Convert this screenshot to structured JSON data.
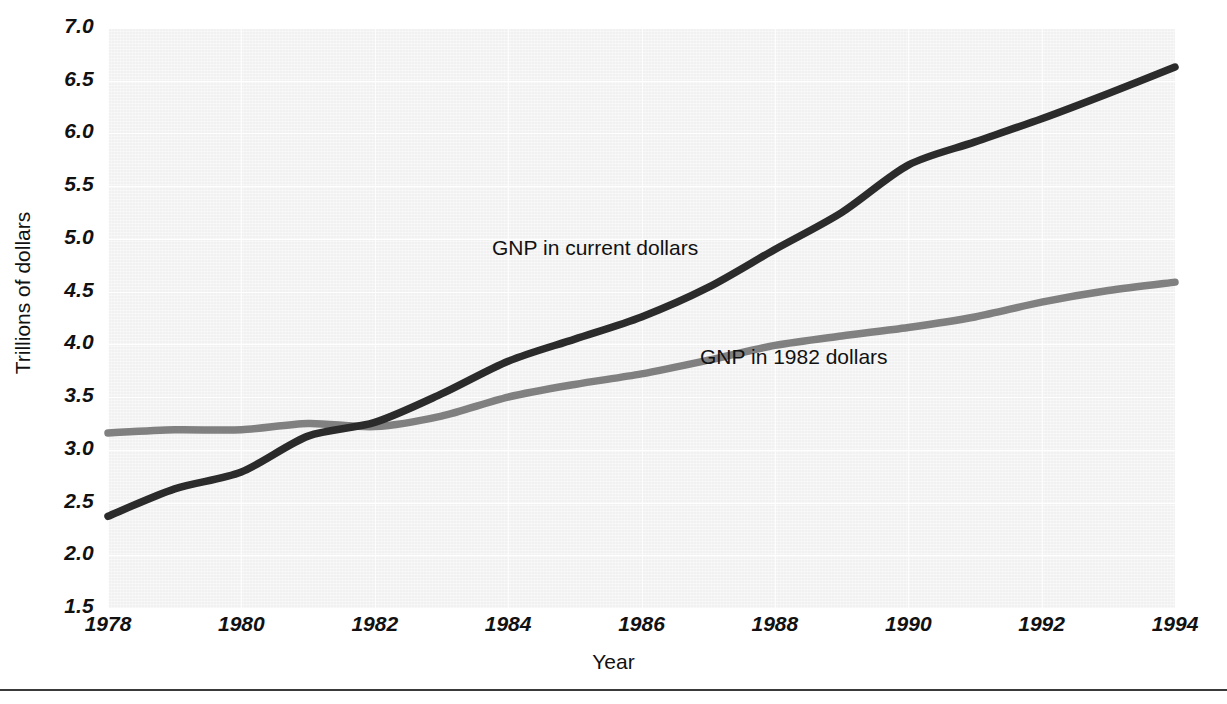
{
  "chart_data": {
    "type": "line",
    "title": "",
    "xlabel": "Year",
    "ylabel": "Trillions of dollars",
    "xlim": [
      1978,
      1994
    ],
    "ylim": [
      1.5,
      7.0
    ],
    "grid": true,
    "legend_position": "inline-annotations",
    "x_ticks": [
      "1978",
      "1980",
      "1982",
      "1984",
      "1986",
      "1988",
      "1990",
      "1992",
      "1994"
    ],
    "y_ticks": [
      "1.5",
      "2.0",
      "2.5",
      "3.0",
      "3.5",
      "4.0",
      "4.5",
      "5.0",
      "5.5",
      "6.0",
      "6.5",
      "7.0"
    ],
    "x": [
      1978,
      1979,
      1980,
      1981,
      1982,
      1983,
      1984,
      1985,
      1986,
      1987,
      1988,
      1989,
      1990,
      1991,
      1992,
      1993,
      1994
    ],
    "series": [
      {
        "name": "GNP in current dollars",
        "color": "#2b2b2b",
        "values": [
          2.37,
          2.63,
          2.79,
          3.13,
          3.26,
          3.53,
          3.84,
          4.05,
          4.26,
          4.54,
          4.9,
          5.25,
          5.7,
          5.92,
          6.14,
          6.38,
          6.63
        ]
      },
      {
        "name": "GNP in 1982 dollars",
        "color": "#808080",
        "values": [
          3.16,
          3.19,
          3.19,
          3.25,
          3.22,
          3.32,
          3.5,
          3.62,
          3.72,
          3.85,
          3.99,
          4.08,
          4.16,
          4.26,
          4.4,
          4.51,
          4.59
        ]
      }
    ],
    "annotations": [
      {
        "text": "GNP in current dollars",
        "series": "GNP in current dollars"
      },
      {
        "text": "GNP in 1982 dollars",
        "series": "GNP in 1982 dollars"
      }
    ]
  },
  "axes": {
    "y_title": "Trillions of dollars",
    "x_title": "Year",
    "y_ticks": [
      "7.0",
      "6.5",
      "6.0",
      "5.5",
      "5.0",
      "4.5",
      "4.0",
      "3.5",
      "3.0",
      "2.5",
      "2.0",
      "1.5"
    ],
    "x_ticks": [
      "1978",
      "1980",
      "1982",
      "1984",
      "1986",
      "1988",
      "1990",
      "1992",
      "1994"
    ]
  },
  "labels": {
    "current_dollars": "GNP in current dollars",
    "constant_1982_dollars": "GNP in 1982 dollars"
  },
  "colors": {
    "current_dollars_line": "#2b2b2b",
    "constant_dollars_line": "#808080",
    "plot_background": "#f1f1f1",
    "text": "#111111",
    "rule": "#3a3a3a"
  }
}
